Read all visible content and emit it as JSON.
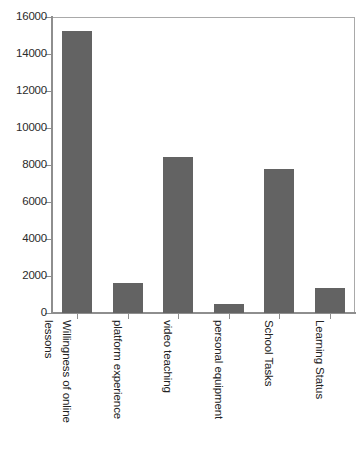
{
  "chart_data": {
    "type": "bar",
    "title": "",
    "subtitle": "",
    "xlabel": "",
    "ylabel": "",
    "categories": [
      "Willingness of online lessons",
      "platform experience",
      "video teaching",
      "personal equipment",
      "School Tasks",
      "Learning Status"
    ],
    "category_label_lines": [
      [
        "lessons",
        "Willingness of online"
      ],
      [
        "platform experience"
      ],
      [
        "video teaching"
      ],
      [
        "personal equipment"
      ],
      [
        "School Tasks"
      ],
      [
        "Learning Status"
      ]
    ],
    "values": [
      15250,
      1620,
      8430,
      460,
      7780,
      1370
    ],
    "ylim": [
      0,
      16000
    ],
    "ytick_values": [
      0,
      2000,
      4000,
      6000,
      8000,
      10000,
      12000,
      14000,
      16000
    ],
    "ytick_labels": [
      "0",
      "2000",
      "4000",
      "6000",
      "8000",
      "10000",
      "12000",
      "14000",
      "16000"
    ],
    "grid": false,
    "legend": null,
    "legend_position": "none",
    "bar_color": "#636363",
    "axis_color": "#8e8e8e",
    "plot_border_color": "#a9a9a9",
    "background_color": "#ffffff",
    "label_rotation_degrees": 90
  },
  "caption": {
    "fragment": ""
  }
}
